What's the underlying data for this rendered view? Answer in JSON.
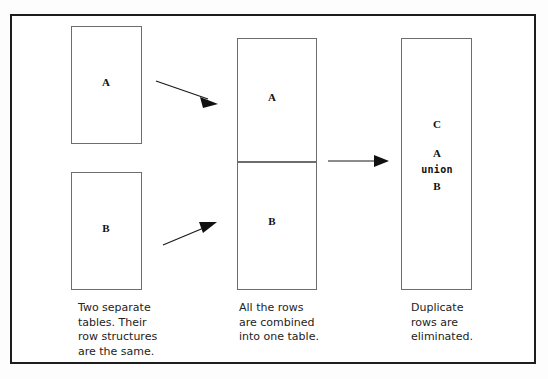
{
  "diagram": {
    "background_color": "#fdfdfd",
    "frame_color": "#1d1d1d",
    "box_border_color": "#6d6d6d",
    "arrow_color": "#1a1a1a"
  },
  "stages": [
    {
      "id": "source-tables",
      "caption": "Two separate\ntables. Their\nrow structures\nare the same.",
      "boxes": [
        {
          "id": "box-a",
          "label": "A"
        },
        {
          "id": "box-b",
          "label": "B"
        }
      ]
    },
    {
      "id": "combined-table",
      "caption": "All the rows\nare combined\ninto one table.",
      "boxes": [
        {
          "id": "combined-upper",
          "label": "A"
        },
        {
          "id": "combined-lower",
          "label": "B"
        }
      ]
    },
    {
      "id": "result-table",
      "caption": "Duplicate\nrows are\neliminated.",
      "boxes": [
        {
          "id": "result-box",
          "label": "C",
          "expression_line_1": "A",
          "expression_line_2": "union",
          "expression_line_3": "B"
        }
      ]
    }
  ],
  "arrows": [
    {
      "id": "arrow-a-to-combined",
      "direction": "down-right"
    },
    {
      "id": "arrow-b-to-combined",
      "direction": "up-right"
    },
    {
      "id": "arrow-combined-to-result",
      "direction": "right"
    }
  ]
}
